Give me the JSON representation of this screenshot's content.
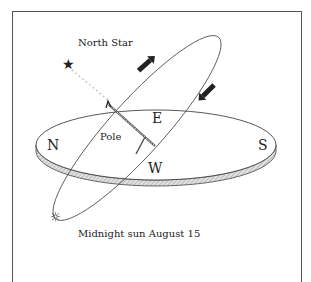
{
  "labels": {
    "north_star": "North Star",
    "pole": "Pole",
    "north": "N",
    "south": "S",
    "east": "E",
    "west": "W",
    "caption": "Midnight sun August 15"
  },
  "icons": {
    "star": "★",
    "sun": "☼"
  },
  "colors": {
    "line": "#444444",
    "disc_edge": "#bbbbbb",
    "arrow": "#222222"
  }
}
